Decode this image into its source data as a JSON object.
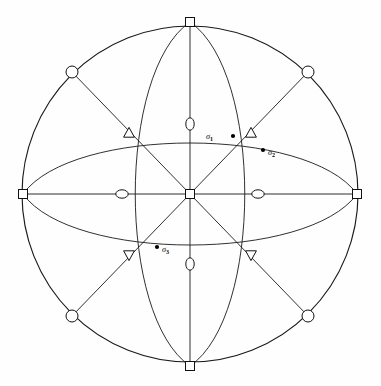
{
  "figure": {
    "type": "stereographic-projection",
    "background_color": "#fefefe",
    "line_color": "#1a1a1a",
    "symbol_fill": "#ffffff",
    "dot_color": "#000000",
    "center": {
      "x": 190,
      "y": 194
    },
    "radius": 168
  },
  "labels": [
    {
      "id": "sigma1",
      "base": "σ",
      "sub": "1",
      "text": "σ₁",
      "x": 213,
      "y": 139,
      "dot_x": 233,
      "dot_y": 136,
      "dot_side": "right"
    },
    {
      "id": "sigma2",
      "base": "σ",
      "sub": "2",
      "text": "σ₂",
      "x": 268,
      "y": 155,
      "dot_x": 263,
      "dot_y": 150,
      "dot_side": "left"
    },
    {
      "id": "sigma3",
      "base": "σ",
      "sub": "3",
      "text": "σ₃",
      "x": 162,
      "y": 252,
      "dot_x": 157,
      "dot_y": 247,
      "dot_side": "left"
    }
  ],
  "symbols": {
    "square": {
      "name": "four-fold-axis",
      "shape": "open-square",
      "size": 9,
      "points": [
        {
          "x": 190,
          "y": 194,
          "label": "center"
        },
        {
          "x": 190,
          "y": 22,
          "label": "north"
        },
        {
          "x": 190,
          "y": 366,
          "label": "south"
        },
        {
          "x": 23,
          "y": 194,
          "label": "west"
        },
        {
          "x": 357,
          "y": 194,
          "label": "east"
        }
      ]
    },
    "circle": {
      "name": "two-fold-axis-rim",
      "shape": "open-circle",
      "radius": 6,
      "points": [
        {
          "x": 72,
          "y": 72,
          "label": "nw-rim"
        },
        {
          "x": 308,
          "y": 72,
          "label": "ne-rim"
        },
        {
          "x": 72,
          "y": 316,
          "label": "sw-rim"
        },
        {
          "x": 308,
          "y": 316,
          "label": "se-rim"
        }
      ]
    },
    "ellipse_v": {
      "name": "two-fold-axis-vertical",
      "shape": "open-ellipse-vertical",
      "rx": 4.2,
      "ry": 6.2,
      "points": [
        {
          "x": 190,
          "y": 124,
          "label": "north-mid"
        },
        {
          "x": 190,
          "y": 264,
          "label": "south-mid"
        }
      ]
    },
    "ellipse_h": {
      "name": "two-fold-axis-horizontal",
      "shape": "open-ellipse-horizontal",
      "rx": 6.2,
      "ry": 4.2,
      "points": [
        {
          "x": 122,
          "y": 194,
          "label": "west-mid"
        },
        {
          "x": 258,
          "y": 194,
          "label": "east-mid"
        }
      ]
    },
    "triangle_up": {
      "name": "three-fold-axis-upper",
      "shape": "open-triangle-up",
      "size": 9,
      "points": [
        {
          "x": 129,
          "y": 133,
          "label": "nw-inner"
        },
        {
          "x": 251,
          "y": 133,
          "label": "ne-inner"
        }
      ]
    },
    "triangle_down": {
      "name": "three-fold-axis-lower",
      "shape": "open-triangle-down",
      "size": 9,
      "points": [
        {
          "x": 129,
          "y": 255,
          "label": "sw-inner"
        },
        {
          "x": 251,
          "y": 255,
          "label": "se-inner"
        }
      ]
    }
  },
  "geometry": {
    "diameters": [
      {
        "name": "horizontal-diameter",
        "x1": 23,
        "y1": 194,
        "x2": 357,
        "y2": 194
      },
      {
        "name": "vertical-diameter",
        "x1": 190,
        "y1": 22,
        "x2": 190,
        "y2": 366
      },
      {
        "name": "diagonal-nw-se",
        "x1": 72,
        "y1": 72,
        "x2": 308,
        "y2": 316
      },
      {
        "name": "diagonal-ne-sw",
        "x1": 308,
        "y1": 72,
        "x2": 72,
        "y2": 316
      }
    ],
    "arcs": [
      {
        "name": "great-circle-vertical-left",
        "from": "north",
        "to": "south",
        "bulge": "left"
      },
      {
        "name": "great-circle-vertical-right",
        "from": "north",
        "to": "south",
        "bulge": "right"
      },
      {
        "name": "great-circle-horizontal-top",
        "from": "west",
        "to": "east",
        "bulge": "top"
      },
      {
        "name": "great-circle-horizontal-bot",
        "from": "west",
        "to": "east",
        "bulge": "bottom"
      }
    ]
  }
}
